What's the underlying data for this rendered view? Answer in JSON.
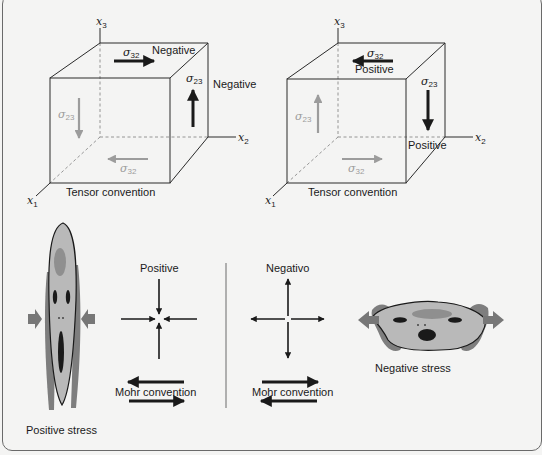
{
  "figure": {
    "panels": [
      {
        "id": "tensor-negative",
        "axes": {
          "x1": "x",
          "x1_sub": "1",
          "x2": "x",
          "x2_sub": "2",
          "x3": "x",
          "x3_sub": "3"
        },
        "top_stress": {
          "symbol": "σ",
          "sub": "32",
          "direction": "right",
          "label": "Negative"
        },
        "side_stress": {
          "symbol": "σ",
          "sub": "23",
          "direction": "up",
          "label": "Negative"
        },
        "hidden_side_stress": {
          "symbol": "σ",
          "sub": "23",
          "direction": "down"
        },
        "hidden_bottom_stress": {
          "symbol": "σ",
          "sub": "32",
          "direction": "left"
        },
        "caption": "Tensor convention"
      },
      {
        "id": "tensor-positive",
        "axes": {
          "x1": "x",
          "x1_sub": "1",
          "x2": "x",
          "x2_sub": "2",
          "x3": "x",
          "x3_sub": "3"
        },
        "top_stress": {
          "symbol": "σ",
          "sub": "32",
          "direction": "left",
          "label": "Positive"
        },
        "side_stress": {
          "symbol": "σ",
          "sub": "23",
          "direction": "down",
          "label": "Positive"
        },
        "hidden_side_stress": {
          "symbol": "σ",
          "sub": "23",
          "direction": "up"
        },
        "hidden_bottom_stress": {
          "symbol": "σ",
          "sub": "32",
          "direction": "right"
        },
        "caption": "Tensor convention"
      }
    ],
    "mohr": [
      {
        "id": "mohr-positive",
        "title": "Positive",
        "arrows": "inward",
        "caption": "Mohr convention",
        "shear_top": "left",
        "shear_bottom": "right"
      },
      {
        "id": "mohr-negative",
        "title": "Negativo",
        "arrows": "outward",
        "caption": "Mohr convention",
        "shear_top": "right",
        "shear_bottom": "left"
      }
    ],
    "faces": [
      {
        "id": "face-compressed",
        "caption": "Positive stress",
        "forces": "compression"
      },
      {
        "id": "face-stretched",
        "caption": "Negative stress",
        "forces": "tension"
      }
    ],
    "colors": {
      "background": "#f4f4f3",
      "ink": "#1a1a1a",
      "hidden_arrow": "#9c9c9c",
      "face_fill": "#b9b9b9",
      "face_shadow": "#7e7e7e",
      "force_arrow": "#777777"
    }
  }
}
